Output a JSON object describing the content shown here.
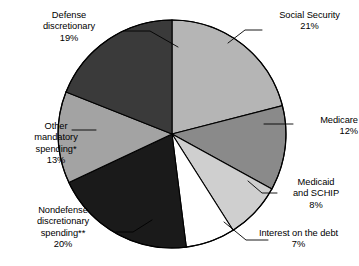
{
  "chart_data": {
    "type": "pie",
    "title": "",
    "subtitle": "",
    "xlabel": "",
    "ylabel": "",
    "legend_position": "none",
    "grid": false,
    "units": "percent",
    "total": 100,
    "start_angle_deg": 0,
    "direction": "clockwise",
    "categories": [
      "Social Security",
      "Medicare",
      "Medicaid and SCHIP",
      "Interest on the debt",
      "Nondefense discretionary spending**",
      "Other mandatory spending*",
      "Defense discretionary"
    ],
    "values": [
      21,
      12,
      8,
      7,
      20,
      13,
      19
    ],
    "colors": [
      "#b5b5b5",
      "#8a8a8a",
      "#cfcfcf",
      "#ffffff",
      "#1a1a1a",
      "#a3a3a3",
      "#3a3a3a"
    ],
    "slices": [
      {
        "name": "Social Security",
        "value": 21,
        "value_label": "21%",
        "color": "#b5b5b5",
        "label_lines": [
          "Social Security",
          "21%"
        ]
      },
      {
        "name": "Medicare",
        "value": 12,
        "value_label": "12%",
        "color": "#8a8a8a",
        "label_lines": [
          "Medicare",
          "12%"
        ]
      },
      {
        "name": "Medicaid and SCHIP",
        "value": 8,
        "value_label": "8%",
        "color": "#cfcfcf",
        "label_lines": [
          "Medicaid",
          "and SCHIP",
          "8%"
        ]
      },
      {
        "name": "Interest on the debt",
        "value": 7,
        "value_label": "7%",
        "color": "#ffffff",
        "label_lines": [
          "Interest on the debt",
          "7%"
        ]
      },
      {
        "name": "Nondefense discretionary spending",
        "value": 20,
        "value_label": "20%",
        "color": "#1a1a1a",
        "label_lines": [
          "Nondefense",
          "discretionary",
          "spending**",
          "20%"
        ]
      },
      {
        "name": "Other mandatory spending",
        "value": 13,
        "value_label": "13%",
        "color": "#a3a3a3",
        "label_lines": [
          "Other",
          "mandatory",
          "spending*",
          "13%"
        ]
      },
      {
        "name": "Defense discretionary",
        "value": 19,
        "value_label": "19%",
        "color": "#3a3a3a",
        "label_lines": [
          "Defense",
          "discretionary",
          "19%"
        ]
      }
    ]
  },
  "labels": {
    "social_security": {
      "l1": "Social Security",
      "l2": "21%"
    },
    "medicare": {
      "l1": "Medicare",
      "l2": "12%"
    },
    "medicaid": {
      "l1": "Medicaid",
      "l2": "and SCHIP",
      "l3": "8%"
    },
    "interest": {
      "l1": "Interest on the debt",
      "l2": "7%"
    },
    "nondefense": {
      "l1": "Nondefense",
      "l2": "discretionary",
      "l3": "spending**",
      "l4": "20%"
    },
    "other_mandatory": {
      "l1": "Other",
      "l2": "mandatory",
      "l3": "spending*",
      "l4": "13%"
    },
    "defense": {
      "l1": "Defense",
      "l2": "discretionary",
      "l3": "19%"
    }
  },
  "style": {
    "outline_color": "#000000",
    "background": "#ffffff",
    "leader_color": "#000000"
  }
}
